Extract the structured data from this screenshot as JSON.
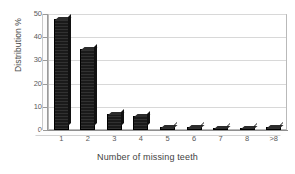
{
  "chart_data": {
    "type": "bar",
    "title": "",
    "xlabel": "Number of missing teeth",
    "ylabel": "Distribution %",
    "categories": [
      "1",
      "2",
      "3",
      "4",
      "5",
      "6",
      "7",
      "8",
      ">8"
    ],
    "values": [
      48,
      35,
      7,
      6,
      1.5,
      1.5,
      1,
      1,
      1.5
    ],
    "ylim": [
      0,
      50
    ],
    "ytick_labels": [
      "0",
      "10",
      "20",
      "30",
      "40",
      "50"
    ],
    "ytick_values": [
      0,
      10,
      20,
      30,
      40,
      50
    ],
    "grid": true,
    "legend": "none",
    "bar_color": "#1a1a1a",
    "style": "3d-column"
  },
  "axes": {
    "y_title": "Distribution %",
    "x_title": "Number of missing teeth"
  }
}
